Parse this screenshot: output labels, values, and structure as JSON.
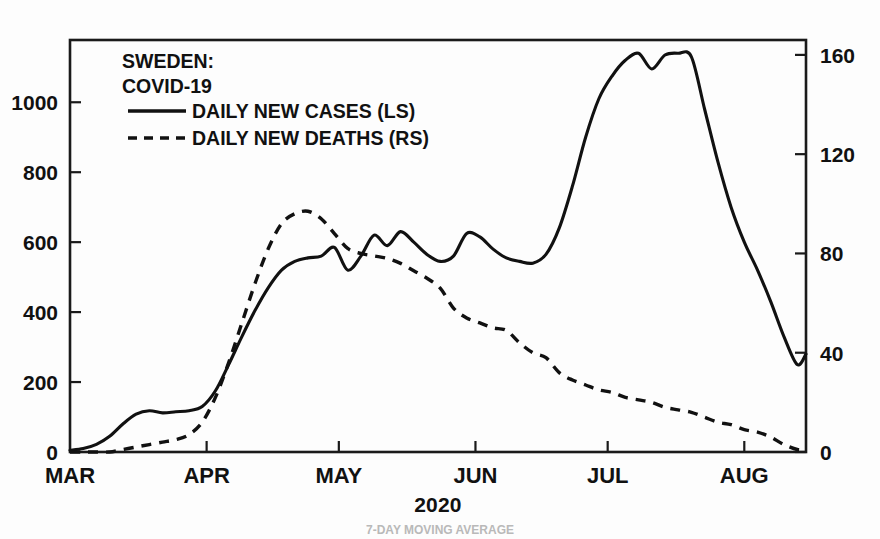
{
  "chart_data": {
    "type": "line",
    "title": "SWEDEN:",
    "subtitle": "COVID-19",
    "xlabel": "2020",
    "ylabel": "",
    "footnote": "7-DAY MOVING AVERAGE",
    "grid": false,
    "legend_position": "top-left",
    "x_tick_labels": [
      "MAR",
      "APR",
      "MAY",
      "JUN",
      "JUL",
      "AUG"
    ],
    "x_tick_days": [
      0,
      31,
      61,
      92,
      122,
      153
    ],
    "x_range_days": [
      0,
      167
    ],
    "left_axis": {
      "name": "DAILY NEW CASES (LS)",
      "ticks": [
        0,
        200,
        400,
        600,
        800,
        1000
      ],
      "ylim": [
        0,
        1178
      ],
      "tick_labels": [
        "0",
        "200",
        "400",
        "600",
        "800",
        "1000"
      ]
    },
    "right_axis": {
      "name": "DAILY NEW DEATHS (RS)",
      "ticks": [
        0,
        40,
        80,
        120,
        160
      ],
      "ylim": [
        0,
        166
      ],
      "tick_labels": [
        "0",
        "40",
        "80",
        "120",
        "160"
      ]
    },
    "series": [
      {
        "name": "DAILY NEW CASES (LS)",
        "axis": "left",
        "style": "solid",
        "color": "#111111",
        "x": [
          0,
          3,
          6,
          9,
          12,
          15,
          18,
          21,
          24,
          27,
          30,
          33,
          36,
          39,
          42,
          45,
          48,
          51,
          54,
          57,
          60,
          63,
          66,
          69,
          72,
          75,
          78,
          81,
          84,
          87,
          90,
          93,
          96,
          99,
          102,
          105,
          108,
          111,
          114,
          117,
          120,
          123,
          126,
          129,
          132,
          135,
          138,
          141,
          144,
          147,
          150,
          153,
          156,
          159,
          162,
          165,
          167
        ],
        "values": [
          5,
          10,
          22,
          45,
          80,
          108,
          118,
          112,
          115,
          118,
          130,
          175,
          250,
          330,
          405,
          470,
          520,
          545,
          555,
          560,
          585,
          520,
          560,
          620,
          590,
          630,
          600,
          565,
          545,
          560,
          625,
          615,
          580,
          555,
          545,
          540,
          565,
          640,
          760,
          900,
          1010,
          1075,
          1120,
          1140,
          1095,
          1135,
          1140,
          1130,
          980,
          830,
          700,
          600,
          520,
          430,
          330,
          250,
          280
        ]
      },
      {
        "name": "DAILY NEW DEATHS (RS)",
        "axis": "right",
        "style": "dashed",
        "color": "#111111",
        "x": [
          0,
          3,
          6,
          9,
          12,
          15,
          18,
          21,
          24,
          27,
          30,
          33,
          36,
          39,
          42,
          45,
          48,
          51,
          54,
          57,
          60,
          63,
          66,
          69,
          72,
          75,
          78,
          81,
          84,
          87,
          90,
          93,
          96,
          99,
          102,
          105,
          108,
          111,
          114,
          117,
          120,
          123,
          126,
          129,
          132,
          135,
          138,
          141,
          144,
          147,
          150,
          153,
          156,
          159,
          162,
          165,
          167
        ],
        "values": [
          0,
          0,
          0,
          0,
          1,
          2,
          3,
          4,
          5,
          7,
          12,
          22,
          36,
          52,
          68,
          82,
          92,
          96,
          97,
          94,
          88,
          82,
          80,
          79,
          78,
          76,
          73,
          70,
          66,
          58,
          54,
          52,
          50,
          49,
          44,
          40,
          38,
          32,
          29,
          27,
          25,
          24,
          22,
          21,
          20,
          18,
          17,
          16,
          14,
          12,
          11,
          9,
          8,
          6,
          3,
          1,
          1
        ]
      }
    ]
  },
  "legend": {
    "items": [
      {
        "label": "DAILY NEW CASES (LS)",
        "style": "solid"
      },
      {
        "label": "DAILY NEW DEATHS (RS)",
        "style": "dashed"
      }
    ]
  }
}
